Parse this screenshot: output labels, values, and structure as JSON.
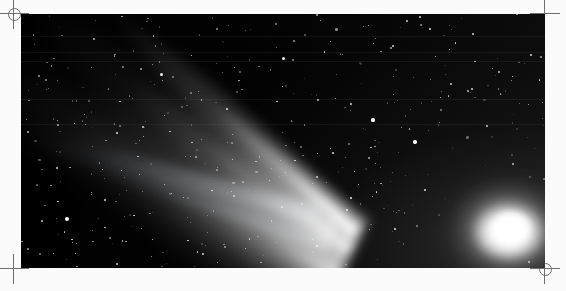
{
  "page": {
    "background_color": "#fbfbfb",
    "caption": ""
  },
  "plate": {
    "name": "comet-photograph",
    "left": 21,
    "top": 14,
    "width": 524,
    "height": 254,
    "sky_color": "#050505",
    "subject": "Comet Hale-Bopp",
    "alt_text": "Long-exposure astrophotograph of a bright comet with a brilliant white coma at lower right and a broad dust tail fanning toward the upper left across a dense star field."
  },
  "registration_marks": [
    {
      "id": "mark-tl",
      "position": "top-left",
      "style": "circle-cross",
      "x": -1,
      "y": -1,
      "color": "#6e6e6e"
    },
    {
      "id": "mark-tr",
      "position": "top-right",
      "style": "cross",
      "x": 530,
      "y": -1,
      "color": "#6e6e6e"
    },
    {
      "id": "mark-bl",
      "position": "bottom-left",
      "style": "cross",
      "x": -1,
      "y": 254,
      "color": "#6e6e6e"
    },
    {
      "id": "mark-br",
      "position": "bottom-right",
      "style": "circle-cross",
      "x": 530,
      "y": 254,
      "color": "#6e6e6e"
    }
  ],
  "comet": {
    "nucleus": {
      "x": 497,
      "y": 228,
      "color": "#ffffff",
      "label": "coma-nucleus"
    },
    "dust_tail": {
      "label": "dust-tail",
      "direction_degrees": -150,
      "length": 470,
      "color": "#e8e8e8",
      "description": "broad bright fan sweeping from the coma toward the upper-left corner"
    },
    "ion_tail": {
      "label": "ion-tail",
      "direction_degrees": -161,
      "length": 330,
      "color": "#c8d0da",
      "description": "narrow faint streak extending to the left across the star field"
    }
  },
  "scanlines": [
    {
      "y": 22,
      "opacity": 0.05
    },
    {
      "y": 38,
      "opacity": 0.05
    },
    {
      "y": 47,
      "opacity": 0.04
    },
    {
      "y": 85,
      "opacity": 0.04
    },
    {
      "y": 110,
      "opacity": 0.03
    }
  ],
  "starfield": {
    "count": 420,
    "color": "#ffffff",
    "seed": 1997,
    "bright_stars": [
      {
        "x": 46,
        "y": 205,
        "r": 1.9,
        "o": 1.0
      },
      {
        "x": 140,
        "y": 60,
        "r": 1.5,
        "o": 0.92
      },
      {
        "x": 206,
        "y": 95,
        "r": 1.4,
        "o": 0.88
      },
      {
        "x": 262,
        "y": 44,
        "r": 1.5,
        "o": 0.9
      },
      {
        "x": 312,
        "y": 139,
        "r": 1.4,
        "o": 0.85
      },
      {
        "x": 330,
        "y": 90,
        "r": 1.3,
        "o": 0.82
      },
      {
        "x": 352,
        "y": 106,
        "r": 1.6,
        "o": 0.95
      },
      {
        "x": 372,
        "y": 32,
        "r": 1.3,
        "o": 0.8
      },
      {
        "x": 394,
        "y": 128,
        "r": 1.7,
        "o": 0.98
      },
      {
        "x": 404,
        "y": 176,
        "r": 1.4,
        "o": 0.86
      },
      {
        "x": 430,
        "y": 70,
        "r": 1.3,
        "o": 0.8
      },
      {
        "x": 452,
        "y": 20,
        "r": 1.4,
        "o": 0.84
      },
      {
        "x": 466,
        "y": 112,
        "r": 1.3,
        "o": 0.78
      },
      {
        "x": 478,
        "y": 58,
        "r": 1.2,
        "o": 0.74
      },
      {
        "x": 492,
        "y": 150,
        "r": 1.2,
        "o": 0.72
      },
      {
        "x": 374,
        "y": 215,
        "r": 1.4,
        "o": 0.88
      },
      {
        "x": 296,
        "y": 232,
        "r": 1.3,
        "o": 0.82
      },
      {
        "x": 182,
        "y": 240,
        "r": 1.3,
        "o": 0.84
      },
      {
        "x": 96,
        "y": 250,
        "r": 1.2,
        "o": 0.78
      },
      {
        "x": 508,
        "y": 248,
        "r": 1.2,
        "o": 0.72
      }
    ]
  }
}
